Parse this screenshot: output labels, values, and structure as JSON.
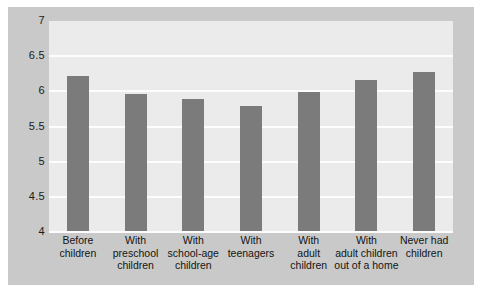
{
  "chart_data": {
    "type": "bar",
    "title": "",
    "subtitle": "",
    "xlabel": "",
    "ylabel": "",
    "ylim": [
      4,
      7
    ],
    "ytick_labels": [
      "7",
      "6.5",
      "6",
      "5.5",
      "5",
      "4.5",
      "4"
    ],
    "ytick_values": [
      7,
      6.5,
      6,
      5.5,
      5,
      4.5,
      4
    ],
    "grid": true,
    "legend": "none",
    "bar_color": "#7b7b7b",
    "plot_background": "#ebebeb",
    "panel_background": "#c9c9c9",
    "gridline_color": "#fdfdfd",
    "categories": [
      "Before children",
      "With preschool children",
      "With school-age children",
      "With teenagers",
      "With adult children",
      "With adult children out of a home",
      "Never had children"
    ],
    "category_lines": [
      [
        "Before",
        "children"
      ],
      [
        "With",
        "preschool",
        "children"
      ],
      [
        "With",
        "school-age",
        "children"
      ],
      [
        "With",
        "teenagers"
      ],
      [
        "With",
        "adult",
        "children"
      ],
      [
        "With",
        "adult children",
        "out of a home"
      ],
      [
        "Never had",
        "children"
      ]
    ],
    "values": [
      6.22,
      5.96,
      5.89,
      5.79,
      5.99,
      6.16,
      6.28
    ]
  }
}
